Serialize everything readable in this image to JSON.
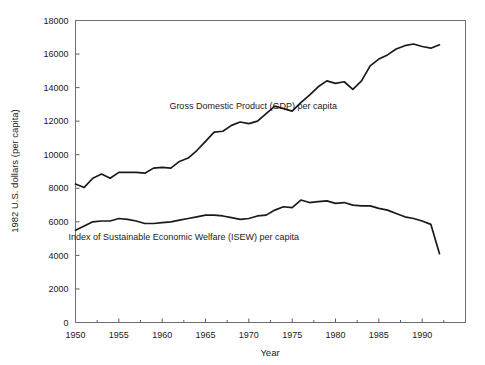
{
  "chart_data": {
    "type": "line",
    "title": "",
    "xlabel": "Year",
    "ylabel": "1982 U.S. dollars (per capita)",
    "xlim": [
      1950,
      1995
    ],
    "ylim": [
      0,
      18000
    ],
    "grid": false,
    "legend_position": "inline-annotation",
    "x_ticks": [
      1950,
      1955,
      1960,
      1965,
      1970,
      1975,
      1980,
      1985,
      1990
    ],
    "x_tick_labels": [
      "1950",
      "1955",
      "1960",
      "1965",
      "1970",
      "1975",
      "1980",
      "1985",
      "1990"
    ],
    "x_minor_ticks": [
      1952.5,
      1957.5,
      1962.5,
      1967.5,
      1972.5,
      1977.5,
      1982.5,
      1987.5,
      1992.5
    ],
    "y_ticks": [
      0,
      2000,
      4000,
      6000,
      8000,
      10000,
      12000,
      14000,
      16000,
      18000
    ],
    "y_tick_labels": [
      "0",
      "2000",
      "4000",
      "6000",
      "8000",
      "10000",
      "12000",
      "14000",
      "16000",
      "18000"
    ],
    "x": [
      1950,
      1951,
      1952,
      1953,
      1954,
      1955,
      1956,
      1957,
      1958,
      1959,
      1960,
      1961,
      1962,
      1963,
      1964,
      1965,
      1966,
      1967,
      1968,
      1969,
      1970,
      1971,
      1972,
      1973,
      1974,
      1975,
      1976,
      1977,
      1978,
      1979,
      1980,
      1981,
      1982,
      1983,
      1984,
      1985,
      1986,
      1987,
      1988,
      1989,
      1990,
      1991,
      1992
    ],
    "series": [
      {
        "name": "Gross Domestic Product (GDP) per capita",
        "label": "Gross Domestic Product (GDP) per capita",
        "color": "#1a1a1a",
        "values": [
          8250,
          8050,
          8600,
          8850,
          8600,
          8950,
          8950,
          8950,
          8900,
          9200,
          9250,
          9200,
          9600,
          9800,
          10250,
          10800,
          11350,
          11400,
          11750,
          11950,
          11850,
          12000,
          12450,
          12900,
          12750,
          12600,
          13100,
          13550,
          14050,
          14400,
          14250,
          14350,
          13900,
          14400,
          15300,
          15700,
          15950,
          16300,
          16500,
          16600,
          16450,
          16350,
          16550
        ]
      },
      {
        "name": "Index of Sustainable Economic Welfare (ISEW) per capita",
        "label": "Index of Sustainable Economic Welfare (ISEW) per capita",
        "color": "#1a1a1a",
        "values": [
          5500,
          5750,
          6000,
          6050,
          6050,
          6200,
          6150,
          6050,
          5900,
          5900,
          5950,
          6000,
          6100,
          6200,
          6300,
          6400,
          6400,
          6350,
          6250,
          6150,
          6200,
          6350,
          6400,
          6700,
          6900,
          6850,
          7300,
          7150,
          7200,
          7250,
          7100,
          7150,
          7000,
          6950,
          6950,
          6800,
          6700,
          6500,
          6300,
          6200,
          6050,
          5850,
          4100
        ]
      }
    ],
    "annotations": [
      {
        "text": "Gross Domestic Product (GDP) per capita",
        "x": 1970.5,
        "y": 12750,
        "anchor": "middle"
      },
      {
        "text": "Index of Sustainable Economic Welfare (ISEW) per capita",
        "x": 1962.5,
        "y": 4900,
        "anchor": "middle"
      }
    ]
  }
}
